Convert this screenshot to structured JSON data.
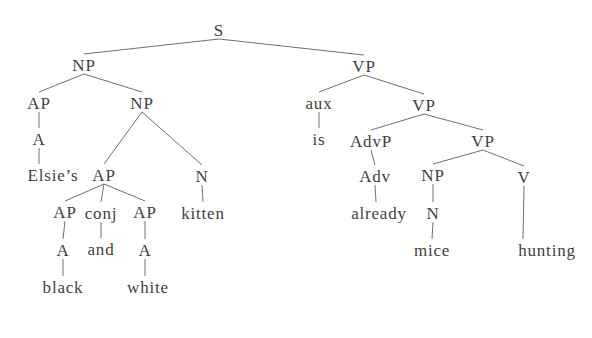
{
  "figure": {
    "background": "#ffffff",
    "text_color": "#3f3f3f",
    "line_color": "#6f6f6f",
    "width": 592,
    "height": 338,
    "tree": {
      "type": "constituency-parse-tree",
      "root_label": "S",
      "leaf_words": [
        "Elsie’s",
        "black",
        "and",
        "white",
        "kitten",
        "is",
        "already",
        "mice",
        "hunting"
      ],
      "nodes": [
        {
          "id": "S",
          "label": "S",
          "x": 219,
          "y": 30
        },
        {
          "id": "NP1",
          "label": "NP",
          "x": 84,
          "y": 65
        },
        {
          "id": "VP1",
          "label": "VP",
          "x": 364,
          "y": 66
        },
        {
          "id": "AP1",
          "label": "AP",
          "x": 39,
          "y": 103
        },
        {
          "id": "NP2",
          "label": "NP",
          "x": 142,
          "y": 103
        },
        {
          "id": "aux",
          "label": "aux",
          "x": 319,
          "y": 103
        },
        {
          "id": "VP2",
          "label": "VP",
          "x": 424,
          "y": 105
        },
        {
          "id": "A1",
          "label": "A",
          "x": 39,
          "y": 139
        },
        {
          "id": "is",
          "label": "is",
          "x": 319,
          "y": 139
        },
        {
          "id": "AdvP",
          "label": "AdvP",
          "x": 371,
          "y": 141
        },
        {
          "id": "VP3",
          "label": "VP",
          "x": 483,
          "y": 141
        },
        {
          "id": "Elsies",
          "label": "Elsie’s",
          "x": 53,
          "y": 175,
          "ax": 39
        },
        {
          "id": "AP2",
          "label": "AP",
          "x": 104,
          "y": 175
        },
        {
          "id": "N1",
          "label": "N",
          "x": 202,
          "y": 176
        },
        {
          "id": "Adv",
          "label": "Adv",
          "x": 375,
          "y": 176
        },
        {
          "id": "NP3",
          "label": "NP",
          "x": 433,
          "y": 175
        },
        {
          "id": "V",
          "label": "V",
          "x": 524,
          "y": 177
        },
        {
          "id": "AP3",
          "label": "AP",
          "x": 65,
          "y": 212
        },
        {
          "id": "conj",
          "label": "conj",
          "x": 101,
          "y": 213
        },
        {
          "id": "AP4",
          "label": "AP",
          "x": 145,
          "y": 212
        },
        {
          "id": "kitten",
          "label": "kitten",
          "x": 203,
          "y": 213
        },
        {
          "id": "already",
          "label": "already",
          "x": 379,
          "y": 213,
          "ax": 376
        },
        {
          "id": "N2",
          "label": "N",
          "x": 433,
          "y": 213
        },
        {
          "id": "A2",
          "label": "A",
          "x": 63,
          "y": 250
        },
        {
          "id": "and",
          "label": "and",
          "x": 101,
          "y": 249
        },
        {
          "id": "A3",
          "label": "A",
          "x": 145,
          "y": 250
        },
        {
          "id": "mice",
          "label": "mice",
          "x": 432,
          "y": 250
        },
        {
          "id": "hunting",
          "label": "hunting",
          "x": 547,
          "y": 250,
          "ax": 523
        },
        {
          "id": "black",
          "label": "black",
          "x": 63,
          "y": 287
        },
        {
          "id": "white",
          "label": "white",
          "x": 148,
          "y": 287,
          "ax": 145
        }
      ],
      "edges": [
        [
          "S",
          "NP1"
        ],
        [
          "S",
          "VP1"
        ],
        [
          "NP1",
          "AP1"
        ],
        [
          "NP1",
          "NP2"
        ],
        [
          "AP1",
          "A1"
        ],
        [
          "A1",
          "Elsies"
        ],
        [
          "NP2",
          "AP2"
        ],
        [
          "NP2",
          "N1"
        ],
        [
          "AP2",
          "AP3"
        ],
        [
          "AP2",
          "conj"
        ],
        [
          "AP2",
          "AP4"
        ],
        [
          "AP3",
          "A2"
        ],
        [
          "A2",
          "black"
        ],
        [
          "conj",
          "and"
        ],
        [
          "AP4",
          "A3"
        ],
        [
          "A3",
          "white"
        ],
        [
          "N1",
          "kitten"
        ],
        [
          "VP1",
          "aux"
        ],
        [
          "VP1",
          "VP2"
        ],
        [
          "aux",
          "is"
        ],
        [
          "VP2",
          "AdvP"
        ],
        [
          "VP2",
          "VP3"
        ],
        [
          "AdvP",
          "Adv"
        ],
        [
          "Adv",
          "already"
        ],
        [
          "VP3",
          "NP3"
        ],
        [
          "VP3",
          "V"
        ],
        [
          "NP3",
          "N2"
        ],
        [
          "N2",
          "mice"
        ],
        [
          "V",
          "hunting"
        ]
      ]
    }
  }
}
